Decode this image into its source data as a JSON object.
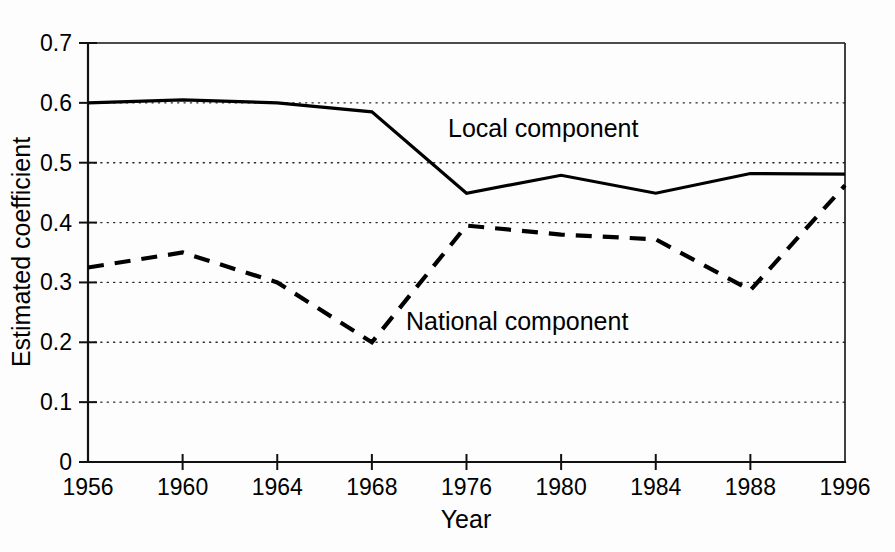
{
  "chart_data": {
    "type": "line",
    "title": "",
    "xlabel": "Year",
    "ylabel": "Estimated coefficient",
    "categories": [
      "1956",
      "1960",
      "1964",
      "1968",
      "1976",
      "1980",
      "1984",
      "1988",
      "1996"
    ],
    "xtick_labels": [
      "1956",
      "1960",
      "1964",
      "1968",
      "1976",
      "1980",
      "1984",
      "1988",
      "1996"
    ],
    "ytick_labels": [
      "0",
      "0.1",
      "0.2",
      "0.3",
      "0.4",
      "0.5",
      "0.6",
      "0.7"
    ],
    "ytick_values": [
      0,
      0.1,
      0.2,
      0.3,
      0.4,
      0.5,
      0.6,
      0.7
    ],
    "ylim": [
      0,
      0.7
    ],
    "grid": "horizontal-dotted",
    "legend_position": "inline-annotations",
    "series": [
      {
        "name": "Local component",
        "style": "solid",
        "label_text": "Local component",
        "values": [
          0.6,
          0.605,
          0.6,
          0.585,
          0.449,
          0.479,
          0.449,
          0.482,
          0.481
        ]
      },
      {
        "name": "National component",
        "style": "dashed",
        "label_text": "National component",
        "values": [
          0.325,
          0.35,
          0.3,
          0.2,
          0.395,
          0.38,
          0.372,
          0.287,
          0.462
        ]
      }
    ],
    "annotations": [
      {
        "text": "Local component",
        "x_category": "1976",
        "y_value": 0.545
      },
      {
        "text": "National component",
        "x_category": "1976",
        "y_value": 0.255
      }
    ],
    "colors": {
      "line": "#000000",
      "grid": "#2a2a2a",
      "axis": "#111111",
      "background": "#fdfdfd"
    }
  }
}
